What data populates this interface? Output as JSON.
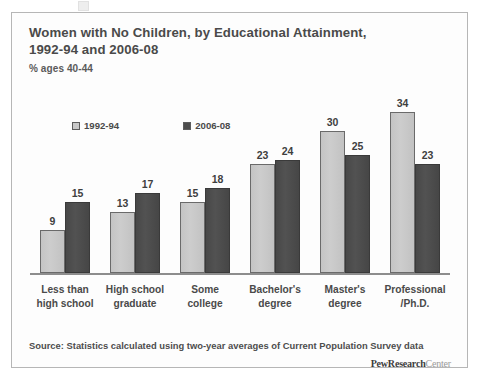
{
  "figure": {
    "title_lines": [
      "Women with No Children, by Educational Attainment,",
      "1992-94 and 2006-08"
    ],
    "subtitle": "% ages 40-44",
    "source": "Source: Statistics calculated using two-year averages of Current Population Survey data",
    "brand_strong": "PewResearch",
    "brand_light": "Center"
  },
  "chart_data": {
    "type": "bar",
    "title": "Women with No Children, by Educational Attainment, 1992-94 and 2006-08",
    "subtitle": "% ages 40-44",
    "xlabel": "",
    "ylabel": "% ages 40-44",
    "ylim": [
      0,
      36
    ],
    "grid": false,
    "legend_position": "top-left",
    "categories": [
      "Less than high school",
      "High school graduate",
      "Some college",
      "Bachelor's degree",
      "Master's degree",
      "Professional /Ph.D."
    ],
    "category_lines": [
      [
        "Less than",
        "high school"
      ],
      [
        "High school",
        "graduate"
      ],
      [
        "Some",
        "college"
      ],
      [
        "Bachelor's",
        "degree"
      ],
      [
        "Master's",
        "degree"
      ],
      [
        "Professional",
        "/Ph.D."
      ]
    ],
    "series": [
      {
        "name": "1992-94",
        "color": "#c9c9c9",
        "values": [
          9,
          13,
          15,
          23,
          30,
          34
        ]
      },
      {
        "name": "2006-08",
        "color": "#4d4d4d",
        "values": [
          15,
          17,
          18,
          24,
          25,
          23
        ]
      }
    ]
  }
}
